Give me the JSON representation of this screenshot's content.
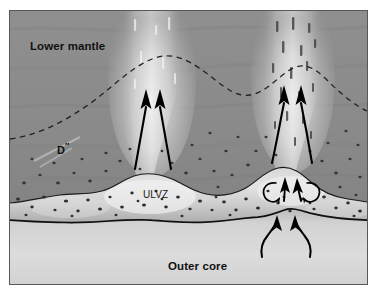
{
  "figure": {
    "labels": {
      "lower_mantle": "Lower mantle",
      "d_double_prime_base": "D",
      "d_double_prime_sup": "″",
      "ulvz": "ULVZ",
      "outer_core": "Outer core"
    },
    "colors": {
      "page_background": "#ffffff",
      "frame_border": "#585858",
      "lower_mantle": "#8e8e8e",
      "lower_mantle_dark": "#7c7c7c",
      "plume_bright": "#e8e8e8",
      "ulvz_fill": "#c9c9c9",
      "ulvz_bright": "#ededed",
      "outer_core": "#cfcfcf",
      "outer_core_light": "#dedede",
      "cmb_line": "#141414",
      "boundary_line": "#1a1a1a",
      "dashed_isotherm": "#222222",
      "arrow": "#000000",
      "inclusion": "#303030",
      "text": "#111111"
    },
    "features": {
      "dashed_isotherm_note": "dashed thermal boundary arcs over both plume roots and dips between them",
      "plumes": [
        {
          "name": "left-plume",
          "x_center": 142,
          "arrow_count": 2
        },
        {
          "name": "right-plume",
          "x_center": 283,
          "arrow_count": 2
        }
      ],
      "ulvz_circulation_arrows": 2,
      "ulvz_vortex_curls": 2,
      "core_upwelling_arrows": 2,
      "inclusion_count": 150
    }
  }
}
